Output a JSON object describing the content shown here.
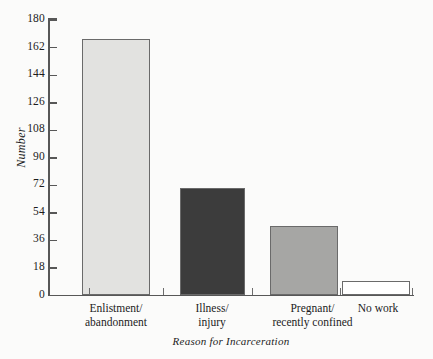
{
  "chart_data": {
    "type": "bar",
    "title": "",
    "xlabel": "Reason for Incarceration",
    "ylabel": "Number",
    "categories": [
      "Enlistment/\nabandonment",
      "Illness/\ninjury",
      "Pregnant/\nrecently confined",
      "No work"
    ],
    "category_lines": [
      [
        "Enlistment/",
        "abandonment"
      ],
      [
        "Illness/",
        "injury"
      ],
      [
        "Pregnant/",
        "recently confined"
      ],
      [
        "No work",
        ""
      ]
    ],
    "values": [
      167,
      70,
      45,
      9
    ],
    "bar_colors": [
      "#e2e2e0",
      "#3c3c3c",
      "#a6a6a4",
      "#ffffff"
    ],
    "bar_border_color": "#6a6a6a",
    "ylim": [
      0,
      180
    ],
    "yticks": [
      0,
      18,
      36,
      54,
      72,
      90,
      108,
      126,
      144,
      162,
      180
    ],
    "ytick_labels": [
      "0",
      "18",
      "36",
      "54",
      "72",
      "90",
      "108",
      "126",
      "144",
      "162",
      "180"
    ],
    "grid": false,
    "legend": "none",
    "axis_color": "#575757",
    "background": "#fbfbfa"
  }
}
